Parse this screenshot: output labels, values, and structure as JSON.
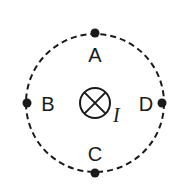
{
  "diagram": {
    "center_symbol": "into-page-current",
    "current_label": "I",
    "points": [
      {
        "label": "A",
        "position": "top"
      },
      {
        "label": "B",
        "position": "left"
      },
      {
        "label": "C",
        "position": "bottom"
      },
      {
        "label": "D",
        "position": "right"
      }
    ],
    "colors": {
      "stroke": "#1a1a1a",
      "background": "#ffffff"
    }
  }
}
